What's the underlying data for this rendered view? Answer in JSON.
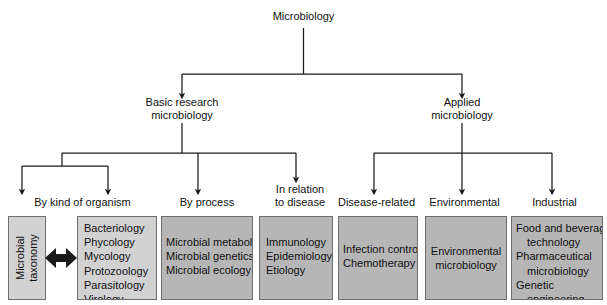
{
  "diagram": {
    "root": {
      "label": "Microbiology"
    },
    "level2": [
      {
        "id": "basic",
        "label": "Basic research\nmicrobiology"
      },
      {
        "id": "applied",
        "label": "Applied\nmicrobiology"
      }
    ],
    "headings": [
      {
        "id": "by-kind-of-organism",
        "label": "By kind of organism"
      },
      {
        "id": "by-process",
        "label": "By process"
      },
      {
        "id": "in-relation-to-disease",
        "label": "In relation\nto disease"
      },
      {
        "id": "disease-related",
        "label": "Disease-related"
      },
      {
        "id": "environmental",
        "label": "Environmental"
      },
      {
        "id": "industrial",
        "label": "Industrial"
      }
    ],
    "boxes": [
      {
        "id": "microbial-taxonomy",
        "orientation": "vertical",
        "shade": "light",
        "lines": [
          "Microbial\ntaxonomy"
        ]
      },
      {
        "id": "organism-list",
        "orientation": "list",
        "shade": "light",
        "lines": [
          "Bacteriology",
          "Phycology",
          "Mycology",
          "Protozoology",
          "Parasitology",
          "Virology"
        ]
      },
      {
        "id": "process-list",
        "orientation": "list",
        "shade": "dark",
        "lines": [
          "Microbial metabolism",
          "Microbial genetics",
          "Microbial ecology"
        ]
      },
      {
        "id": "disease-relation-list",
        "orientation": "list",
        "shade": "dark",
        "lines": [
          "Immunology",
          "Epidemiology",
          "Etiology"
        ]
      },
      {
        "id": "disease-related-list",
        "orientation": "list",
        "shade": "dark",
        "lines": [
          "Infection control",
          "Chemotherapy"
        ]
      },
      {
        "id": "environmental-list",
        "orientation": "center",
        "shade": "dark",
        "lines": [
          "Environmental",
          "microbiology"
        ]
      },
      {
        "id": "industrial-list",
        "orientation": "list-indent",
        "shade": "dark",
        "lines": [
          "Food and beverage",
          "technology",
          "Pharmaceutical",
          "microbiology",
          "Genetic",
          "engineering"
        ],
        "indent": [
          false,
          true,
          false,
          true,
          false,
          true
        ]
      }
    ],
    "connector": {
      "id": "taxonomy-organism-link",
      "type": "double-headed-arrow"
    },
    "colors": {
      "line": "#1a1a1a",
      "box_border": "#6f6f6f",
      "box_light": "#d2d2d2",
      "box_dark": "#b6b6b6",
      "text": "#111111",
      "background": "#ffffff"
    }
  }
}
